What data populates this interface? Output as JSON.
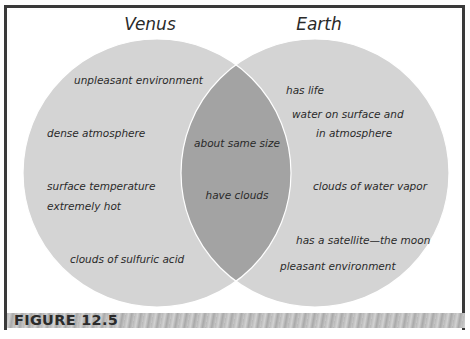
{
  "diagram": {
    "type": "venn",
    "sets": [
      {
        "name": "Venus",
        "only_items": [
          "unpleasant environment",
          "dense atmosphere",
          "surface temperature extremely hot",
          "clouds of sulfuric acid"
        ]
      },
      {
        "name": "Earth",
        "only_items": [
          "has life",
          "water on surface and in atmosphere",
          "clouds of water vapor",
          "has a satellite—the moon",
          "pleasant environment"
        ]
      }
    ],
    "shared_items": [
      "about same size",
      "have clouds"
    ],
    "colors": {
      "circle_fill": "#d4d4d4",
      "overlap_fill": "#a3a3a3",
      "circle_stroke": "#ffffff",
      "frame": "#3a3a3a"
    }
  },
  "labels": {
    "venus_title": "Venus",
    "earth_title": "Earth",
    "venus": {
      "l0": "unpleasant environment",
      "l1": "dense atmosphere",
      "l2a": "surface temperature",
      "l2b": "extremely hot",
      "l3": "clouds of sulfuric acid"
    },
    "shared": {
      "l0": "about same size",
      "l1": "have clouds"
    },
    "earth": {
      "l0": "has life",
      "l1a": "water on surface and",
      "l1b": "in atmosphere",
      "l2": "clouds of water vapor",
      "l3": "has a satellite—the moon",
      "l4": "pleasant environment"
    }
  },
  "figure_caption": "FIGURE 12.5"
}
